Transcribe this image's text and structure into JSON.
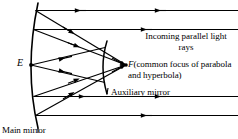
{
  "figure": {
    "title_alt": "Cassegrain reflecting telescope ray diagram",
    "background_color": "#ffffff",
    "stroke_color": "#000000",
    "labels": {
      "incoming_rays": "Incoming parallel light rays",
      "focus_point": "F",
      "focus_description": "(common focus of parabola and hyperbola)",
      "auxiliary_mirror": "Auxiliary mirror",
      "main_mirror": "Main mirror",
      "eyepiece_point": "E"
    },
    "elements": {
      "main_mirror": {
        "name": "Main mirror",
        "shape": "parabola",
        "orientation": "opens-right"
      },
      "auxiliary_mirror": {
        "name": "Auxiliary mirror",
        "shape": "hyperbola",
        "orientation": "opens-right"
      },
      "incoming_ray_count": 4,
      "arrow_direction": "leftward"
    },
    "points": {
      "E": {
        "x": 31,
        "y": 65
      },
      "F": {
        "x": 126,
        "y": 65
      }
    }
  }
}
